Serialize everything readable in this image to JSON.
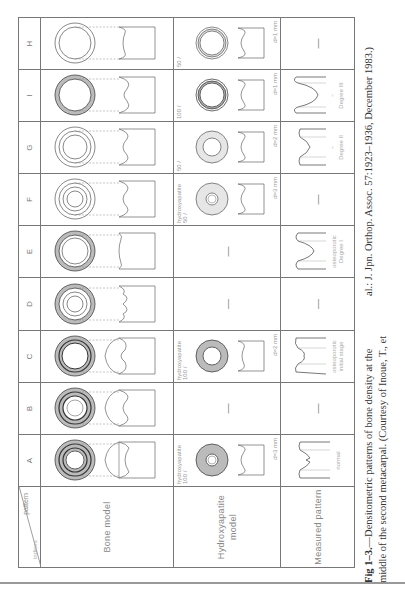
{
  "figure": {
    "column_header_label": "pattern",
    "row_header_label": "indices",
    "patterns": [
      "A",
      "B",
      "C",
      "D",
      "E",
      "F",
      "G",
      "I",
      "H"
    ],
    "rows": [
      {
        "label": "Bone model"
      },
      {
        "label_line1": "Hydroxyapatite",
        "label_line2": "model"
      },
      {
        "label": "Measured pattern"
      }
    ],
    "hydroxyapatite": {
      "A": {
        "material": "hydroxyapatite",
        "concentration": "100 / ",
        "thickness": "d=3 mm"
      },
      "B": {
        "value": "—"
      },
      "C": {
        "material": "hydroxyapatite",
        "concentration": "100 / ",
        "thickness": "d=2 mm"
      },
      "D": {
        "value": "—"
      },
      "E": {
        "value": "—"
      },
      "F": {
        "material": "hydroxyapatite",
        "concentration": "50 / ",
        "thickness": "d=3 mm"
      },
      "G": {
        "concentration": "50 / ",
        "thickness": "d=2 mm"
      },
      "I": {
        "concentration": "100 / ",
        "thickness": "d=1 mm"
      },
      "H": {
        "concentration": "50 / ",
        "thickness": "d=1 mm"
      }
    },
    "measured": {
      "A": {
        "label": "normal"
      },
      "B": {
        "value": "—"
      },
      "C": {
        "label1": "osteoporotic",
        "label2": "initial stage"
      },
      "D": {
        "value": "—"
      },
      "E": {
        "label1": "osteoporotic",
        "label2": "Degree I"
      },
      "F": {
        "value": "—"
      },
      "G": {
        "label1": "\"",
        "label2": "Degree II"
      },
      "I": {
        "label1": "\"",
        "label2": "Degree III"
      },
      "H": {
        "value": "—"
      }
    }
  },
  "caption": {
    "line1_bold": "Fig 1–3.",
    "line1_rest": "—Densitometric patterns of bone density at the",
    "line1_cont": "al.: J. Jpn. Orthop. Assoc. 57:1923–1936, December 1983.)",
    "line2": "middle of the second metacarpal. (Courtesy of Inoue, T., et"
  }
}
